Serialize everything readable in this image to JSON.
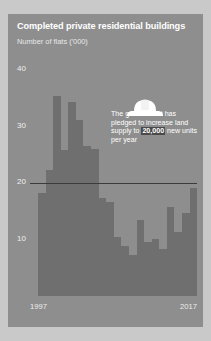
{
  "card": {
    "title": "Completed private residential buildings",
    "subtitle": "Number of flats ('000)"
  },
  "annotation": {
    "icon": "hard-hat-icon",
    "text_before": "The government has pledged to increase land supply to ",
    "highlight": "20,000",
    "text_after": " new units per year"
  },
  "colors": {
    "card_background": "#8e8e8e",
    "bar": "#6f6f6f",
    "reference_line": "#3b3b3b",
    "highlight_background": "#4a4a4a",
    "text": "#ffffff"
  },
  "chart_data": {
    "type": "bar",
    "title": "Completed private residential buildings",
    "subtitle": "Number of flats ('000)",
    "xlabel": "",
    "ylabel": "Number of flats ('000)",
    "categories": [
      "1997",
      "1998",
      "1999",
      "2000",
      "2001",
      "2002",
      "2003",
      "2004",
      "2005",
      "2006",
      "2007",
      "2008",
      "2009",
      "2010",
      "2011",
      "2012",
      "2013",
      "2014",
      "2015",
      "2016",
      "2017"
    ],
    "values": [
      18.2,
      22.3,
      35.3,
      25.8,
      34.2,
      31.0,
      26.4,
      26.0,
      17.3,
      16.6,
      10.5,
      8.8,
      7.2,
      13.4,
      9.5,
      10.1,
      8.3,
      15.7,
      11.3,
      14.6,
      19.0
    ],
    "x_tick_labels": [
      "1997",
      "2017"
    ],
    "y_ticks": [
      10,
      20,
      30,
      40
    ],
    "ylim": [
      0,
      42
    ],
    "grid": false,
    "legend": false,
    "reference_line": {
      "value": 20,
      "label": "20,000 new units per year target"
    },
    "annotations": [
      {
        "text": "The government has pledged to increase land supply to 20,000 new units per year",
        "highlight": "20,000"
      }
    ]
  }
}
